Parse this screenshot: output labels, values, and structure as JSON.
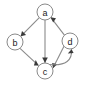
{
  "figure": {
    "type": "directed-graph",
    "title": "",
    "background_color": "#ffffff",
    "edge_color": "#8a8a8a",
    "arrow_color": "#3a3a3a",
    "node_fill": "#ffffff",
    "node_stroke": "#8a8a8a",
    "label_color": "#1a1a1a",
    "node_radius": 8
  },
  "nodes": [
    {
      "id": "a",
      "label": "a",
      "cx": 45,
      "cy": 12
    },
    {
      "id": "b",
      "label": "b",
      "cx": 15,
      "cy": 42
    },
    {
      "id": "c",
      "label": "c",
      "cx": 45,
      "cy": 71
    },
    {
      "id": "d",
      "label": "d",
      "cx": 70,
      "cy": 41
    }
  ],
  "edges": [
    {
      "id": "a-b",
      "from": "a",
      "to": "b",
      "shape": "straight",
      "directed": true
    },
    {
      "id": "a-c",
      "from": "a",
      "to": "c",
      "shape": "straight",
      "directed": true
    },
    {
      "id": "b-c",
      "from": "b",
      "to": "c",
      "shape": "straight",
      "directed": true
    },
    {
      "id": "d-a",
      "from": "d",
      "to": "a",
      "shape": "straight",
      "directed": true
    },
    {
      "id": "d-c",
      "from": "d",
      "to": "c",
      "shape": "straight",
      "directed": true
    },
    {
      "id": "c-d",
      "from": "c",
      "to": "d",
      "shape": "curved",
      "directed": true
    }
  ],
  "paths": {
    "a_b_line": "M 39.3 17.7 L 20.7 36.3",
    "a_b_arrow": "M 20.7 36.3 L 26.1 35.0 L 22.0 31.0 Z",
    "a_c_line": "M 45 20 L 45 63",
    "a_c_arrow": "M 45 63 L 42.2 57.5 L 47.8 57.5 Z",
    "b_c_line": "M 20.0 48.3 L 38.6 65.6",
    "b_c_arrow": "M 38.6 65.6 L 35.7 60.1 L 33.9 65.4 Z",
    "d_a_line": "M 65.0 35.8 L 50.6 17.2",
    "d_a_arrow": "M 50.6 17.2 L 53.2 22.5 L 56.0 18.3 Z",
    "d_c_line": "M 64.1 45.9 L 53.0 68.0",
    "d_c_arrow": "M 53.0 68.0 L 57.5 64.3 L 52.1 63.0 Z",
    "c_d_curve": "M 50.0 64.5 C 66.0 66.0 72.5 60.0 71.5 49.3",
    "c_d_arrow": "M 71.5 49.3 L 67.8 53.5 L 73.6 53.0 Z"
  }
}
